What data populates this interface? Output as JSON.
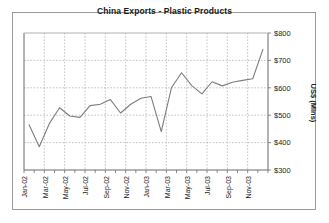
{
  "chart_data": {
    "type": "line",
    "title": "China Exports - Plastic Products",
    "xlabel": "",
    "ylabel": "US$ (Mlns)",
    "ylim": [
      300,
      800
    ],
    "ytick_values": [
      300,
      400,
      500,
      600,
      700,
      800
    ],
    "ytick_labels": [
      "$300",
      "$400",
      "$500",
      "$600",
      "$700",
      "$800"
    ],
    "grid": true,
    "legend": false,
    "x": [
      "Jan-02",
      "Feb-02",
      "Mar-02",
      "Apr-02",
      "May-02",
      "Jun-02",
      "Jul-02",
      "Aug-02",
      "Sep-02",
      "Oct-02",
      "Nov-02",
      "Dec-02",
      "Jan-03",
      "Feb-03",
      "Mar-03",
      "Apr-03",
      "May-03",
      "Jun-03",
      "Jul-03",
      "Aug-03",
      "Sep-03",
      "Oct-03",
      "Nov-03",
      "Dec-03"
    ],
    "xtick_labels": [
      "Jan-02",
      "Mar-02",
      "May-02",
      "Jul-02",
      "Sep-02",
      "Nov-02",
      "Jan-03",
      "Mar-03",
      "May-03",
      "Jul-03",
      "Sep-03",
      "Nov-03"
    ],
    "values": [
      465,
      385,
      470,
      527,
      497,
      492,
      535,
      540,
      557,
      508,
      540,
      562,
      568,
      440,
      600,
      655,
      608,
      578,
      622,
      607,
      620,
      627,
      633,
      740
    ],
    "series": [
      {
        "name": "China Exports - Plastic Products",
        "color": "#808080",
        "values": [
          465,
          385,
          470,
          527,
          497,
          492,
          535,
          540,
          557,
          508,
          540,
          562,
          568,
          440,
          600,
          655,
          608,
          578,
          622,
          607,
          620,
          627,
          633,
          740
        ]
      }
    ]
  },
  "colors": {
    "line": "#7d7d7d",
    "grid": "#b5b5b5",
    "axis": "#6b6b6b",
    "frame": "#9a9a9a",
    "text": "#1a1a1a"
  }
}
